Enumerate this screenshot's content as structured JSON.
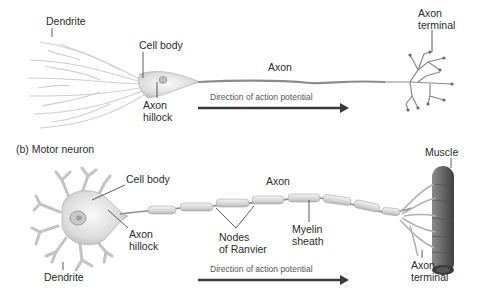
{
  "panel_a": {
    "labels": {
      "dendrite": "Dendrite",
      "cell_body": "Cell body",
      "axon": "Axon",
      "axon_hillock_1": "Axon",
      "axon_hillock_2": "hillock",
      "axon_terminal_1": "Axon",
      "axon_terminal_2": "terminal",
      "direction": "Direction of action potential"
    }
  },
  "panel_b": {
    "title": "(b) Motor neuron",
    "labels": {
      "cell_body": "Cell body",
      "axon": "Axon",
      "axon_hillock_1": "Axon",
      "axon_hillock_2": "hillock",
      "nodes_1": "Nodes",
      "nodes_2": "of Ranvier",
      "myelin_1": "Myelin",
      "myelin_2": "sheath",
      "dendrite": "Dendrite",
      "muscle": "Muscle",
      "axon_terminal_1": "Axon",
      "axon_terminal_2": "terminal",
      "direction": "Direction of action potential"
    }
  },
  "colors": {
    "neuron_fill": "#e9e9e9",
    "neuron_stroke": "#9a9a9a",
    "arrow": "#3a3a3a",
    "muscle": "#6e6e6e",
    "leader_line": "#333333"
  }
}
